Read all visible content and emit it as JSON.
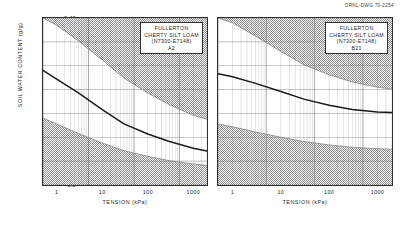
{
  "drawing_number": "ORNL-DWG 70-2254",
  "axes": {
    "y_title": "SOIL WATER CONTENT (g/g)",
    "x_title": "TENSION (kPa)",
    "y_ticks": [
      "0.40",
      "0.35",
      "0.30",
      "0.25",
      "0.20",
      "0.15",
      "0.10",
      "0.5"
    ],
    "x_ticks": [
      "1",
      "10",
      "100",
      "1000"
    ]
  },
  "panels": [
    {
      "id": "panel-a2",
      "legend": {
        "line1": "FULLERTON",
        "line2": "CHERTY SILT LOAM",
        "line3": "(N7300-E7148)",
        "line4": "A2"
      }
    },
    {
      "id": "panel-b21",
      "legend": {
        "line1": "FULLERTON",
        "line2": "CHERTY SILT LOAM",
        "line3": "(N7300-E7148)",
        "line4": "B21"
      }
    }
  ],
  "colors": {
    "curve": "#1a1a1a",
    "frame": "#2f2f2f",
    "grid": "#6f6f6f",
    "shade": "#8d8d8d",
    "background": "#ffffff"
  },
  "chart_data": {
    "type": "line",
    "xlabel": "TENSION (kPa)",
    "ylabel": "SOIL WATER CONTENT (g/g)",
    "x_scale": "log",
    "y_scale": "linear",
    "xlim": [
      0.5,
      2000
    ],
    "ylim": [
      0.05,
      0.4
    ],
    "x_ticks": [
      1,
      10,
      100,
      1000
    ],
    "y_ticks": [
      0.05,
      0.1,
      0.15,
      0.2,
      0.25,
      0.3,
      0.35,
      0.4
    ],
    "grid": true,
    "legend_position": "top-right-inside",
    "panels": [
      {
        "name": "A2",
        "label": "FULLERTON CHERTY SILT LOAM (N7300-E7148) A2",
        "x": [
          0.5,
          1,
          3,
          10,
          30,
          100,
          300,
          1000,
          2000
        ],
        "series": [
          {
            "name": "mean water content",
            "values": [
              0.29,
              0.272,
              0.243,
              0.208,
              0.178,
              0.157,
              0.141,
              0.127,
              0.121
            ]
          },
          {
            "name": "upper envelope",
            "values": [
              0.4,
              0.385,
              0.352,
              0.312,
              0.274,
              0.243,
              0.218,
              0.196,
              0.188
            ]
          },
          {
            "name": "lower envelope",
            "values": [
              0.19,
              0.178,
              0.158,
              0.138,
              0.122,
              0.11,
              0.101,
              0.094,
              0.091
            ]
          }
        ]
      },
      {
        "name": "B21",
        "label": "FULLERTON CHERTY SILT LOAM (N7300-E7148) B21",
        "x": [
          0.5,
          1,
          3,
          10,
          30,
          100,
          300,
          1000,
          2000
        ],
        "series": [
          {
            "name": "mean water content",
            "values": [
              0.283,
              0.277,
              0.263,
              0.246,
              0.23,
              0.217,
              0.208,
              0.203,
              0.202
            ]
          },
          {
            "name": "upper envelope",
            "values": [
              0.4,
              0.39,
              0.362,
              0.33,
              0.302,
              0.281,
              0.266,
              0.255,
              0.251
            ]
          },
          {
            "name": "lower envelope",
            "values": [
              0.178,
              0.172,
              0.161,
              0.15,
              0.141,
              0.134,
              0.129,
              0.126,
              0.125
            ]
          }
        ]
      }
    ]
  }
}
